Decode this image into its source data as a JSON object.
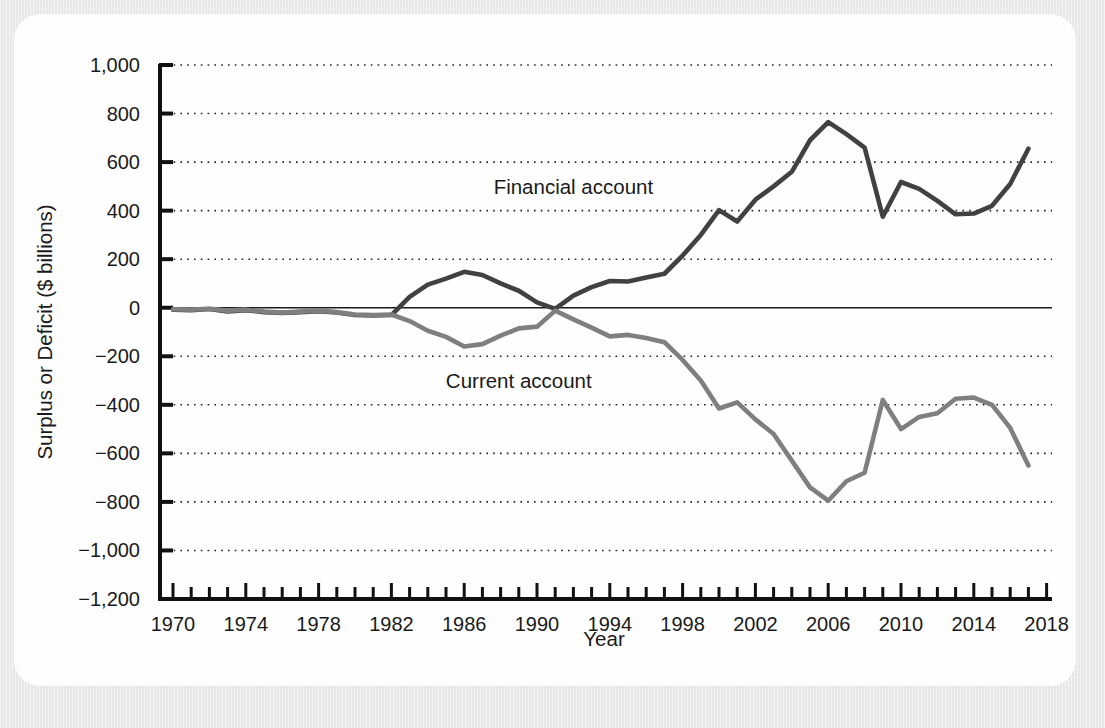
{
  "chart_data": {
    "type": "line",
    "title": "",
    "xlabel": "Year",
    "ylabel": "Surplus or Deficit ($ billions)",
    "xlim": [
      1970,
      2018
    ],
    "ylim": [
      -1200,
      1000
    ],
    "ytick_step": 200,
    "grid": "horizontal-dotted",
    "legend": "inline-annotations",
    "xticks_major": [
      "1970",
      "1974",
      "1978",
      "1982",
      "1986",
      "1990",
      "1994",
      "1998",
      "2002",
      "2006",
      "2010",
      "2014",
      "2018"
    ],
    "xticks_major_values": [
      1970,
      1974,
      1978,
      1982,
      1986,
      1990,
      1994,
      1998,
      2002,
      2006,
      2010,
      2014,
      2018
    ],
    "xtick_minor_step": 1,
    "yticks": [
      "1,000",
      "800",
      "600",
      "400",
      "200",
      "0",
      "-200",
      "-400",
      "-600",
      "-800",
      "-1,000",
      "-1,200"
    ],
    "ytick_values": [
      1000,
      800,
      600,
      400,
      200,
      0,
      -200,
      -400,
      -600,
      -800,
      -1000,
      -1200
    ],
    "x": [
      1970,
      1971,
      1972,
      1973,
      1974,
      1975,
      1976,
      1977,
      1978,
      1979,
      1980,
      1981,
      1982,
      1983,
      1984,
      1985,
      1986,
      1987,
      1988,
      1989,
      1990,
      1991,
      1992,
      1993,
      1994,
      1995,
      1996,
      1997,
      1998,
      1999,
      2000,
      2001,
      2002,
      2003,
      2004,
      2005,
      2006,
      2007,
      2008,
      2009,
      2010,
      2011,
      2012,
      2013,
      2014,
      2015,
      2016,
      2017
    ],
    "series": [
      {
        "name": "Financial account",
        "color": "#414141",
        "label_x": 1992.0,
        "label_y": 470,
        "values": [
          -8,
          -10,
          -5,
          -15,
          -10,
          -18,
          -22,
          -18,
          -14,
          -20,
          -30,
          -32,
          -30,
          45,
          95,
          120,
          148,
          135,
          100,
          70,
          22,
          -5,
          50,
          85,
          110,
          108,
          125,
          140,
          215,
          300,
          402,
          355,
          445,
          500,
          560,
          690,
          765,
          715,
          660,
          375,
          518,
          490,
          440,
          385,
          388,
          420,
          510,
          655
        ]
      },
      {
        "name": "Current account",
        "color": "#7f7f7f",
        "label_x": 1989.0,
        "label_y": -330,
        "values": [
          -6,
          -8,
          -4,
          -12,
          -8,
          -16,
          -20,
          -16,
          -12,
          -18,
          -28,
          -30,
          -28,
          -55,
          -95,
          -120,
          -160,
          -150,
          -115,
          -85,
          -78,
          -12,
          -48,
          -82,
          -118,
          -112,
          -125,
          -142,
          -215,
          -300,
          -415,
          -390,
          -460,
          -520,
          -630,
          -740,
          -795,
          -715,
          -680,
          -380,
          -500,
          -450,
          -435,
          -375,
          -370,
          -400,
          -495,
          -650
        ]
      }
    ]
  },
  "figure": {
    "x_axis_title": "Year",
    "y_axis_title": "Surplus or Deficit ($ billions)"
  }
}
